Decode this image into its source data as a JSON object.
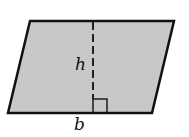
{
  "figure": {
    "shape": "parallelogram",
    "fill_color": "#c8c8c8",
    "stroke_color": "#111111",
    "vertices": {
      "top_left": [
        30,
        21
      ],
      "top_right": [
        174,
        21
      ],
      "bottom_right": [
        152,
        113
      ],
      "bottom_left": [
        8,
        113
      ]
    },
    "height_line": {
      "style": "dashed",
      "x": 93,
      "y_top": 21,
      "y_bottom": 113
    },
    "right_angle_marker": {
      "x": 93,
      "y": 99,
      "size": 14
    }
  },
  "labels": {
    "height": "h",
    "base": "b"
  }
}
